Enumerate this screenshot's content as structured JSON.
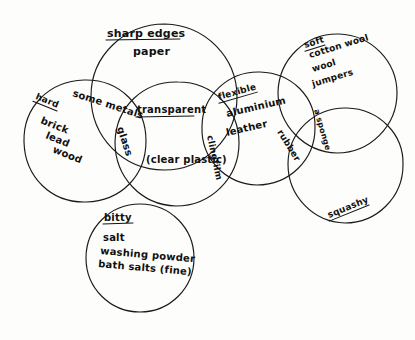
{
  "diagram": {
    "type": "venn",
    "style": "hand-drawn pencil sketch on white paper",
    "stroke_color": "#1a1a1a",
    "background_color": "#fdfdfb",
    "sets": [
      {
        "id": "hard",
        "heading": "hard",
        "heading_underlined": true,
        "items": [
          "brick",
          "lead",
          "wood"
        ],
        "cx": 85,
        "cy": 141,
        "r": 61
      },
      {
        "id": "sharp-edges",
        "heading": "sharp edges",
        "heading_underlined": true,
        "items": [
          "paper"
        ],
        "cx": 164,
        "cy": 97,
        "r": 73
      },
      {
        "id": "transparent",
        "heading": "transparent",
        "heading_underlined": true,
        "items": [
          "(clear plastic)"
        ],
        "cx": 177,
        "cy": 143,
        "r": 62
      },
      {
        "id": "flexible",
        "heading": "flexible",
        "heading_underlined": true,
        "items": [
          "aluminium",
          "leather"
        ],
        "cx": 258,
        "cy": 128,
        "r": 57
      },
      {
        "id": "soft",
        "heading": "soft",
        "heading_underlined": true,
        "items": [
          "cotton wool",
          "wool",
          "jumpers"
        ],
        "cx": 337,
        "cy": 93,
        "r": 60
      },
      {
        "id": "squashy",
        "heading": "squashy",
        "heading_underlined": true,
        "items": [],
        "cx": 345,
        "cy": 165,
        "r": 58
      },
      {
        "id": "bitty",
        "heading": "bitty",
        "heading_underlined": true,
        "items": [
          "salt",
          "washing powder",
          "bath salts (fine)"
        ],
        "cx": 140,
        "cy": 258,
        "r": 54
      }
    ],
    "intersection_labels": [
      {
        "id": "some-metals",
        "text": "some metals",
        "between": [
          "hard",
          "sharp-edges"
        ],
        "rotation": 18
      },
      {
        "id": "glass",
        "text": "glass",
        "between": [
          "hard",
          "sharp-edges",
          "transparent"
        ],
        "rotation": 72
      },
      {
        "id": "clingfilm",
        "text": "clingfilm",
        "between": [
          "transparent",
          "flexible"
        ],
        "rotation": 78
      },
      {
        "id": "rubber",
        "text": "rubber",
        "between": [
          "flexible",
          "squashy"
        ],
        "rotation": 60
      },
      {
        "id": "a-sponge",
        "text": "a sponge",
        "between": [
          "flexible",
          "soft",
          "squashy"
        ],
        "rotation": 72
      }
    ]
  }
}
